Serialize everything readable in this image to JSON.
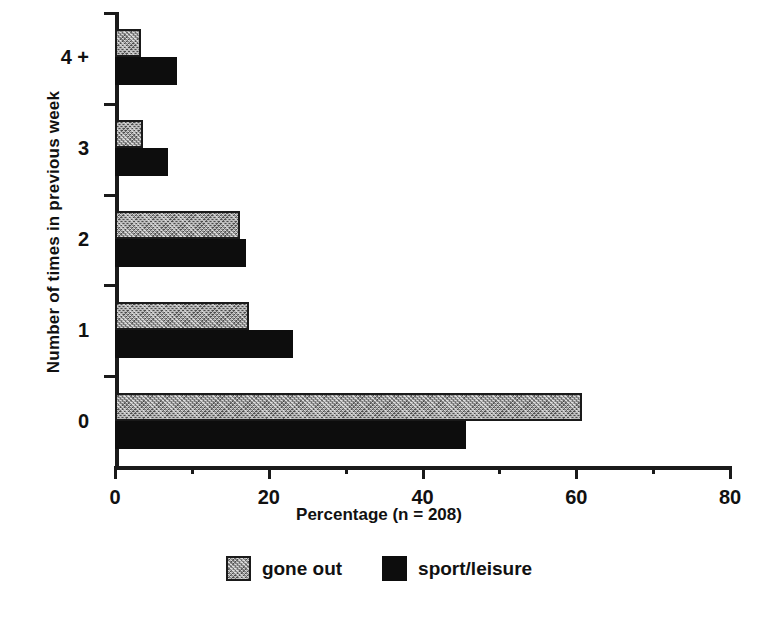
{
  "chart_data": {
    "type": "bar",
    "orientation": "horizontal",
    "title": "",
    "xlabel": "Percentage (n = 208)",
    "ylabel": "Number of times in previous week",
    "categories": [
      "0",
      "1",
      "2",
      "3",
      "4 +"
    ],
    "xlim": [
      0,
      80
    ],
    "xticks": [
      0,
      20,
      40,
      60,
      80
    ],
    "xtick_labels": [
      "0",
      "20",
      "40",
      "60",
      "80"
    ],
    "xminorticks": [
      10,
      30,
      50,
      70
    ],
    "grid": false,
    "legend_position": "bottom-center",
    "series": [
      {
        "name": "gone out",
        "color": "#9d9d9d",
        "values": [
          60.8,
          17.4,
          16.2,
          3.7,
          3.4
        ]
      },
      {
        "name": "sport/leisure",
        "color": "#0d0d0d",
        "values": [
          45.6,
          23.1,
          17.0,
          6.9,
          8.1
        ]
      }
    ]
  },
  "legend": {
    "entries": [
      {
        "label": "gone out"
      },
      {
        "label": "sport/leisure"
      }
    ]
  }
}
